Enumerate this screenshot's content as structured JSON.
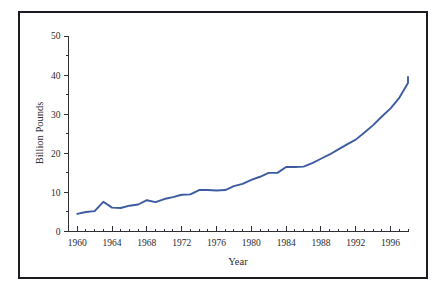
{
  "figure": {
    "background_color": "#ffffff",
    "frame_color": "#1b1b22",
    "axis_color": "#2f2f36"
  },
  "axes": {
    "y_title": "Billion Pounds",
    "x_title": "Year"
  },
  "chart_data": {
    "type": "line",
    "title": "",
    "subtitle": "",
    "xlabel": "Year",
    "ylabel": "Billion Pounds",
    "xlim": [
      1959,
      1998
    ],
    "ylim": [
      0,
      50
    ],
    "grid": false,
    "legend": "none",
    "x_tick_labels": [
      "1960",
      "1964",
      "1968",
      "1972",
      "1976",
      "1980",
      "1984",
      "1988",
      "1992",
      "1996"
    ],
    "x_major_ticks": [
      1960,
      1964,
      1968,
      1972,
      1976,
      1980,
      1984,
      1988,
      1992,
      1996
    ],
    "x_minor_tick_step": 1,
    "y_tick_labels": [
      "0",
      "10",
      "20",
      "30",
      "40",
      "50"
    ],
    "y_major_ticks": [
      0,
      10,
      20,
      30,
      40,
      50
    ],
    "y_minor_ticks": [
      5,
      15,
      25,
      35,
      45
    ],
    "series": [
      {
        "name": "Billion Pounds",
        "color": "#3c5ba0",
        "x": [
          1960,
          1961,
          1962,
          1963,
          1964,
          1965,
          1966,
          1967,
          1968,
          1969,
          1970,
          1971,
          1972,
          1973,
          1974,
          1975,
          1976,
          1977,
          1978,
          1979,
          1980,
          1981,
          1982,
          1983,
          1984,
          1985,
          1986,
          1987,
          1988,
          1989,
          1990,
          1991,
          1992,
          1993,
          1994,
          1995,
          1996,
          1997,
          1998
        ],
        "values": [
          4.5,
          5.0,
          5.2,
          7.6,
          6.1,
          6.0,
          6.6,
          6.9,
          8.0,
          7.5,
          8.3,
          8.8,
          9.4,
          9.5,
          10.6,
          10.6,
          10.5,
          10.6,
          11.6,
          12.2,
          13.2,
          14.0,
          15.0,
          15.0,
          16.5,
          16.5,
          16.6,
          17.5,
          18.6,
          19.7,
          21.0,
          22.3,
          23.5,
          25.3,
          27.2,
          29.4,
          31.5,
          34.2,
          38.0
        ]
      }
    ],
    "final_value": 39.5,
    "final_year": 1998
  }
}
